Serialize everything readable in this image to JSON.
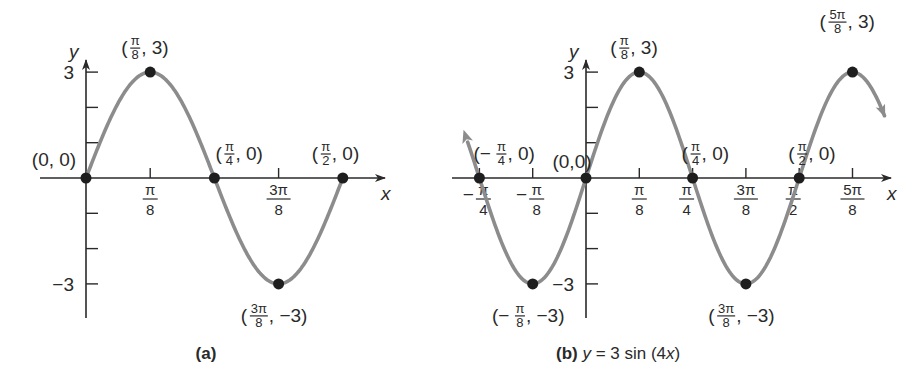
{
  "chart_data": [
    {
      "type": "line",
      "panel": "a",
      "caption": "(a)",
      "function": "y = 3 sin(4x)",
      "xlabel": "x",
      "ylabel": "y",
      "x_range_radians": [
        0,
        1.5708
      ],
      "ylim": [
        -3,
        3
      ],
      "y_ticks": [
        {
          "value": 3,
          "label": "3"
        },
        {
          "value": 2,
          "label": ""
        },
        {
          "value": 1,
          "label": ""
        },
        {
          "value": -1,
          "label": ""
        },
        {
          "value": -2,
          "label": ""
        },
        {
          "value": -3,
          "label": "−3"
        }
      ],
      "x_ticks": [
        {
          "k": 1,
          "num": "π",
          "den": "8"
        },
        {
          "k": 3,
          "num": "3π",
          "den": "8"
        }
      ],
      "points": [
        {
          "k": 0,
          "y": 0,
          "label": "(0, 0)"
        },
        {
          "k": 1,
          "y": 3,
          "label": "(π/8, 3)"
        },
        {
          "k": 2,
          "y": 0,
          "label": "(π/4, 0)"
        },
        {
          "k": 3,
          "y": -3,
          "label": "(3π/8, −3)"
        },
        {
          "k": 4,
          "y": 0,
          "label": "(π/2, 0)"
        }
      ]
    },
    {
      "type": "line",
      "panel": "b",
      "caption": "(b) y = 3 sin (4x)",
      "function": "y = 3 sin(4x)",
      "xlabel": "x",
      "ylabel": "y",
      "x_range_radians": [
        -0.8,
        1.98
      ],
      "ylim": [
        -3,
        3
      ],
      "y_ticks": [
        {
          "value": 3,
          "label": "3"
        },
        {
          "value": 2,
          "label": ""
        },
        {
          "value": 1,
          "label": ""
        },
        {
          "value": -1,
          "label": ""
        },
        {
          "value": -2,
          "label": ""
        },
        {
          "value": -3,
          "label": "−3"
        }
      ],
      "x_ticks": [
        {
          "k": -2,
          "num": "−π",
          "den": "4"
        },
        {
          "k": -1,
          "num": "−π",
          "den": "8"
        },
        {
          "k": 1,
          "num": "π",
          "den": "8"
        },
        {
          "k": 2,
          "num": "π",
          "den": "4"
        },
        {
          "k": 3,
          "num": "3π",
          "den": "8"
        },
        {
          "k": 4,
          "num": "π",
          "den": "2"
        },
        {
          "k": 5,
          "num": "5π",
          "den": "8"
        }
      ],
      "points": [
        {
          "k": -2,
          "y": 0,
          "label": "(−π/4, 0)"
        },
        {
          "k": -1,
          "y": -3,
          "label": "(−π/8, −3)"
        },
        {
          "k": 0,
          "y": 0,
          "label": "(0,0)"
        },
        {
          "k": 1,
          "y": 3,
          "label": "(π/8, 3)"
        },
        {
          "k": 2,
          "y": 0,
          "label": "(π/4, 0)"
        },
        {
          "k": 3,
          "y": -3,
          "label": "(3π/8, −3)"
        },
        {
          "k": 4,
          "y": 0,
          "label": "(π/2, 0)"
        },
        {
          "k": 5,
          "y": 3,
          "label": "(5π/8, 3)"
        }
      ]
    }
  ],
  "captions": {
    "a": "(a)",
    "b_bold": "(b)",
    "b_eq_y": "y",
    "b_eq_mid": " = 3 sin (4",
    "b_eq_x": "x",
    "b_eq_end": ")"
  },
  "axis_labels": {
    "x": "x",
    "y": "y"
  },
  "y_tick_labels": {
    "pos": "3",
    "neg": "−3"
  },
  "colors": {
    "curve": "#8c8c8c",
    "axis": "#2a2a2a",
    "point": "#1e1e1e"
  }
}
